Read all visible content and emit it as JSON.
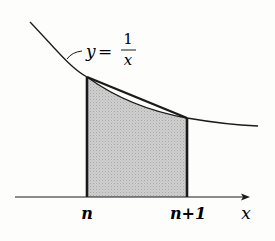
{
  "figure": {
    "curve_label": {
      "y": "y",
      "equals": "=",
      "numerator": "1",
      "denominator": "x"
    },
    "axis": {
      "x_label": "x",
      "ticks": [
        {
          "label": "n",
          "position": "left"
        },
        {
          "label": "n+1",
          "position": "right"
        }
      ]
    },
    "colors": {
      "stroke": "#1a1a1a",
      "shading": "#c9c9c9",
      "background": "#fdfdfc"
    }
  }
}
